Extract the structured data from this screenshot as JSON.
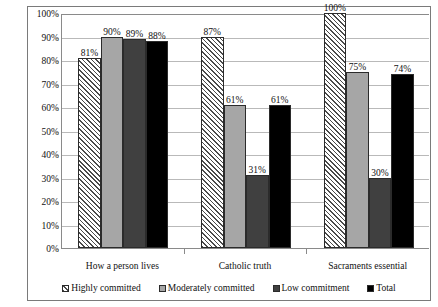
{
  "chart_data": {
    "type": "bar",
    "title": "",
    "subtitle": "",
    "xlabel": "",
    "ylabel": "",
    "categories": [
      "How a person lives",
      "Catholic truth",
      "Sacraments essential"
    ],
    "series": [
      {
        "name": "Highly committed",
        "values": [
          81,
          90,
          100
        ],
        "color": "#ffffff",
        "pattern": "diagonal-hatch"
      },
      {
        "name": "Moderately committed",
        "values": [
          90,
          61,
          75
        ],
        "color": "#a6a6a6",
        "pattern": "solid"
      },
      {
        "name": "Low commitment",
        "values": [
          89,
          31,
          30
        ],
        "color": "#404040",
        "pattern": "solid"
      },
      {
        "name": "Total",
        "values": [
          88,
          61,
          74
        ],
        "color": "#000000",
        "pattern": "solid"
      }
    ],
    "data_labels": [
      [
        "81%",
        "90%",
        "89%",
        "88%"
      ],
      [
        "87%",
        "61%",
        "31%",
        "61%"
      ],
      [
        "100%",
        "75%",
        "30%",
        "74%"
      ]
    ],
    "group_values": [
      [
        81,
        90,
        89,
        88
      ],
      [
        87,
        61,
        31,
        61
      ],
      [
        100,
        75,
        30,
        74
      ]
    ],
    "ylim": [
      0,
      100
    ],
    "ytick_values": [
      0,
      10,
      20,
      30,
      40,
      50,
      60,
      70,
      80,
      90,
      100
    ],
    "ytick_labels": [
      "0%",
      "10%",
      "20%",
      "30%",
      "40%",
      "50%",
      "60%",
      "70%",
      "80%",
      "90%",
      "100%"
    ],
    "grid": true,
    "grid_axis": "y",
    "legend_position": "bottom",
    "legend_entries": [
      "Highly committed",
      "Moderately committed",
      "Low commitment",
      "Total"
    ]
  }
}
